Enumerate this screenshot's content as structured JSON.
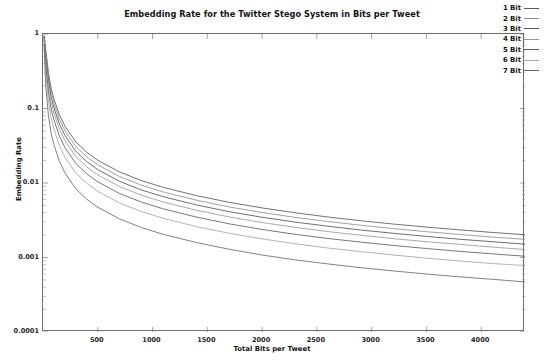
{
  "chart_data": {
    "type": "line",
    "title": "Embedding Rate for the Twitter Stego System in Bits per Tweet",
    "xlabel": "Total Bits per Tweet",
    "ylabel": "Embedding Rate",
    "xscale": "linear",
    "yscale": "log",
    "xlim": [
      0,
      4400
    ],
    "ylim": [
      0.0001,
      1
    ],
    "grid": false,
    "legend_position": "top-right",
    "xticks": [
      500,
      1000,
      1500,
      2000,
      2500,
      3000,
      3500,
      4000
    ],
    "xtick_labels": [
      "500",
      "1000",
      "1500",
      "2000",
      "2500",
      "3000",
      "3500",
      "4000"
    ],
    "yticks": [
      1,
      0.1,
      0.01,
      0.001,
      0.0001
    ],
    "ytick_labels": [
      "1",
      "0.1",
      "0.01",
      "0.001",
      "0.0001"
    ],
    "x": [
      10,
      25,
      50,
      75,
      100,
      150,
      200,
      300,
      400,
      500,
      700,
      900,
      1100,
      1400,
      1700,
      2000,
      2300,
      2600,
      2900,
      3200,
      3500,
      3800,
      4100,
      4400
    ],
    "series": [
      {
        "name": "1 Bit",
        "color": "#5a5a5a",
        "values": [
          0.95,
          0.62,
          0.3,
          0.185,
          0.135,
          0.082,
          0.058,
          0.0355,
          0.0258,
          0.0202,
          0.01405,
          0.01075,
          0.00872,
          0.00678,
          0.0055,
          0.00463,
          0.00399,
          0.0035,
          0.00312,
          0.00281,
          0.00256,
          0.00235,
          0.00217,
          0.00202
        ]
      },
      {
        "name": "2 Bit",
        "color": "#8f8f8f",
        "values": [
          0.93,
          0.56,
          0.265,
          0.163,
          0.118,
          0.0715,
          0.0505,
          0.0308,
          0.0224,
          0.0175,
          0.01218,
          0.00932,
          0.00756,
          0.00588,
          0.00477,
          0.00402,
          0.00346,
          0.00304,
          0.00271,
          0.00244,
          0.00222,
          0.00204,
          0.00188,
          0.00175
        ]
      },
      {
        "name": "3 Bit",
        "color": "#555555",
        "values": [
          0.91,
          0.5,
          0.232,
          0.141,
          0.102,
          0.0617,
          0.0436,
          0.0266,
          0.0193,
          0.01512,
          0.01051,
          0.00805,
          0.00653,
          0.00508,
          0.00412,
          0.00347,
          0.00299,
          0.00263,
          0.00234,
          0.00211,
          0.00192,
          0.00176,
          0.00163,
          0.00151
        ]
      },
      {
        "name": "4 Bit",
        "color": "#9a9a9a",
        "values": [
          0.88,
          0.44,
          0.199,
          0.12,
          0.0868,
          0.0524,
          0.037,
          0.0226,
          0.0164,
          0.01284,
          0.00893,
          0.00684,
          0.00555,
          0.00431,
          0.0035,
          0.00295,
          0.00254,
          0.00223,
          0.00199,
          0.00179,
          0.00163,
          0.0015,
          0.00138,
          0.00128
        ]
      },
      {
        "name": "5 Bit",
        "color": "#606060",
        "values": [
          0.85,
          0.375,
          0.163,
          0.0977,
          0.0703,
          0.0424,
          0.0299,
          0.01826,
          0.01327,
          0.01039,
          0.00722,
          0.00553,
          0.00449,
          0.00349,
          0.00283,
          0.00238,
          0.00205,
          0.0018,
          0.00161,
          0.00145,
          0.00132,
          0.00121,
          0.00112,
          0.00104
        ]
      },
      {
        "name": "6 Bit",
        "color": "#a5a5a5",
        "values": [
          0.8,
          0.3,
          0.124,
          0.0735,
          0.0527,
          0.0317,
          0.0223,
          0.01362,
          0.0099,
          0.00775,
          0.00539,
          0.00413,
          0.00335,
          0.0026,
          0.00211,
          0.00178,
          0.00153,
          0.00134,
          0.0012,
          0.00108,
          0.00098,
          0.0009,
          0.00083,
          0.00078
        ]
      },
      {
        "name": "7 Bit",
        "color": "#6a6a6a",
        "values": [
          0.72,
          0.205,
          0.079,
          0.046,
          0.0327,
          0.01952,
          0.0137,
          0.00834,
          0.00605,
          0.00473,
          0.00329,
          0.00252,
          0.00204,
          0.00159,
          0.00129,
          0.00108,
          0.00093,
          0.00082,
          0.00073,
          0.00066,
          0.0006,
          0.00055,
          0.00051,
          0.00047
        ]
      }
    ]
  }
}
